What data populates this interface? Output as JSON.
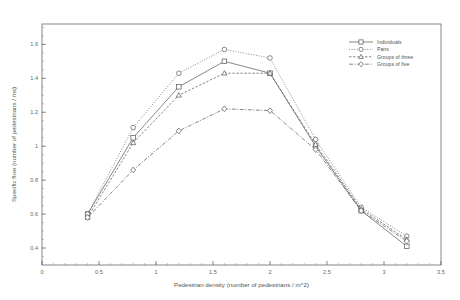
{
  "chart_data": {
    "type": "line",
    "title": "",
    "xlabel": "Pedestrian density (number of pedestrians / m^2)",
    "ylabel": "Specific flow (number of pedestrians / ms)",
    "xlim": [
      0,
      3.5
    ],
    "ylim": [
      0.3,
      1.72
    ],
    "xticks": [
      "0",
      "0.5",
      "1",
      "1.5",
      "2",
      "2.5",
      "3",
      "3.5"
    ],
    "xtick_values": [
      0,
      0.5,
      1,
      1.5,
      2,
      2.5,
      3,
      3.5
    ],
    "yticks": [
      "0.4",
      "0.6",
      "0.8",
      "1",
      "1.2",
      "1.4",
      "1.6"
    ],
    "ytick_values": [
      0.4,
      0.6,
      0.8,
      1.0,
      1.2,
      1.4,
      1.6
    ],
    "grid": false,
    "legend_position": "top-right",
    "x": [
      0.4,
      0.8,
      1.2,
      1.6,
      2.0,
      2.4,
      2.8,
      3.2
    ],
    "series": [
      {
        "name": "Individuals",
        "marker": "square",
        "dash": "none",
        "values": [
          0.6,
          1.05,
          1.35,
          1.5,
          1.43,
          1.0,
          0.62,
          0.41
        ]
      },
      {
        "name": "Pairs",
        "marker": "circle",
        "dash": "dotted",
        "values": [
          0.6,
          1.11,
          1.43,
          1.57,
          1.52,
          1.04,
          0.64,
          0.47
        ]
      },
      {
        "name": "Groups of three",
        "marker": "triangle",
        "dash": "dashed",
        "values": [
          0.58,
          1.02,
          1.3,
          1.43,
          1.43,
          1.01,
          0.63,
          0.45
        ]
      },
      {
        "name": "Groups of five",
        "marker": "diamond",
        "dash": "dashdot",
        "values": [
          0.58,
          0.86,
          1.09,
          1.22,
          1.21,
          0.98,
          0.62,
          0.44
        ]
      }
    ]
  },
  "axis": {
    "x_title": "Pedestrian density (number of pedestrians / m^2)",
    "y_title": "Specific flow (number of pedestrians / ms)"
  },
  "legend": {
    "entries": [
      {
        "label": "Individuals"
      },
      {
        "label": "Pairs"
      },
      {
        "label": "Groups of three"
      },
      {
        "label": "Groups of five"
      }
    ]
  }
}
